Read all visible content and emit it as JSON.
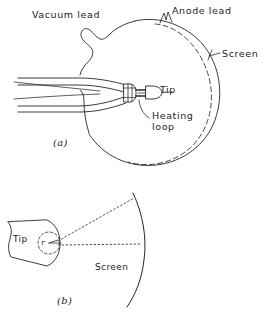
{
  "figure": {
    "background_color": "#ffffff",
    "ink_color": "#232323",
    "caption_text": "",
    "panels": [
      {
        "id": "a",
        "panel_label": "(a)",
        "description": "field emission tube with spherical bulb, vacuum lead stub, anode lead, phosphor screen, emitter tip and heating loop",
        "labels": [
          {
            "name": "vacuum-lead-label",
            "text": "Vacuum lead"
          },
          {
            "name": "anode-lead-label",
            "text": "Anode lead"
          },
          {
            "name": "screen-label",
            "text": "Screen"
          },
          {
            "name": "tip-label",
            "text": "Tip"
          },
          {
            "name": "heating-loop-label",
            "line1": "Heating",
            "line2": "loop"
          }
        ]
      },
      {
        "id": "b",
        "panel_label": "(b)",
        "description": "magnified tip geometry with radius of curvature r and projection rays onto curved screen",
        "labels": [
          {
            "name": "tip-label",
            "text": "Tip"
          },
          {
            "name": "radius-label",
            "text": "r"
          },
          {
            "name": "screen-label",
            "text": "Screen"
          }
        ]
      }
    ]
  }
}
